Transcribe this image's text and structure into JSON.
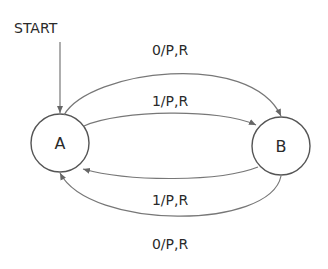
{
  "diagram": {
    "type": "state-machine",
    "start_label": "START",
    "states": [
      {
        "id": "A",
        "label": "A",
        "initial": true
      },
      {
        "id": "B",
        "label": "B",
        "initial": false
      }
    ],
    "transitions": [
      {
        "from": "A",
        "to": "B",
        "label": "0/P,R",
        "position": "outer-top"
      },
      {
        "from": "A",
        "to": "B",
        "label": "1/P,R",
        "position": "inner-top"
      },
      {
        "from": "B",
        "to": "A",
        "label": "1/P,R",
        "position": "inner-bottom"
      },
      {
        "from": "B",
        "to": "A",
        "label": "0/P,R",
        "position": "outer-bottom"
      }
    ],
    "colors": {
      "stroke": "#555555",
      "text": "#2a2a2a",
      "background": "#ffffff"
    }
  }
}
